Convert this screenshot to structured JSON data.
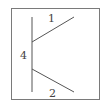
{
  "diagram": {
    "type": "line-segment-diagram",
    "labels": {
      "upper_segment": "1",
      "vertical_segment": "4",
      "lower_segment": "2"
    },
    "colors": {
      "frame": "#7a7a7a",
      "lines": "#555555",
      "text": "#444444",
      "background": "#ffffff"
    },
    "segments": [
      {
        "id": "vertical",
        "label": "4",
        "from": [
          32,
          17
        ],
        "to": [
          32,
          92
        ]
      },
      {
        "id": "upper",
        "label": "1",
        "from": [
          32,
          42
        ],
        "to": [
          74,
          17
        ]
      },
      {
        "id": "lower",
        "label": "2",
        "from": [
          32,
          69
        ],
        "to": [
          74,
          92
        ]
      }
    ]
  }
}
